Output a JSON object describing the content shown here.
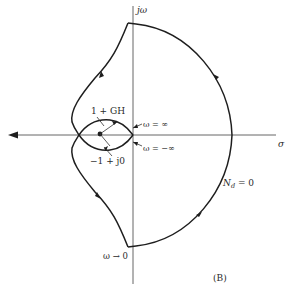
{
  "figure": {
    "panel_label": "(B)",
    "axes": {
      "vertical_label": "jω",
      "horizontal_label": "σ"
    },
    "annotations": {
      "one_plus_gh": "1 + GH",
      "omega_inf": "ω = ∞",
      "omega_neg_inf": "ω = −∞",
      "critical_point": "−1 + j0",
      "nd_zero": "N",
      "nd_sub": "d",
      "nd_eq": " = 0",
      "omega_to_zero": "ω → 0"
    },
    "colors": {
      "line": "#1e1e1e",
      "axis": "#555555",
      "background": "#ffffff"
    }
  }
}
